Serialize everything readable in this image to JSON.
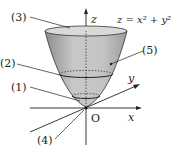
{
  "diagram": {
    "equation": "z = x² + y²",
    "axes": {
      "x": "x",
      "y": "y",
      "z": "z",
      "origin": "O"
    },
    "labels": [
      "(1)",
      "(2)",
      "(3)",
      "(4)",
      "(5)"
    ],
    "colors": {
      "surface": "#bdbdbd",
      "surface_dark": "#9a9a9a",
      "line": "#222222"
    }
  }
}
